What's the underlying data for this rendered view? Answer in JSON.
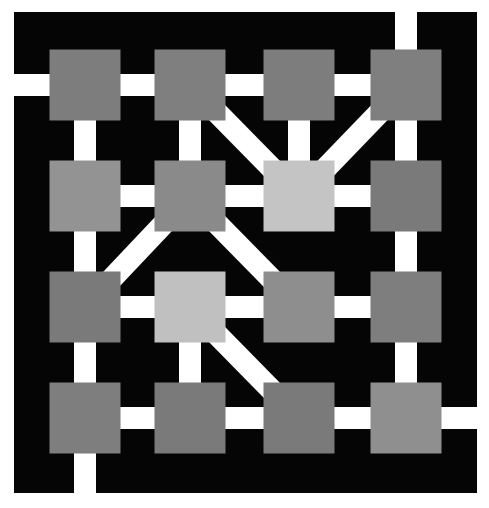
{
  "game": {
    "title": "Network connection grid puzzle",
    "grid": {
      "rows": 4,
      "cols": 4
    },
    "colors": {
      "background": "#ffffff",
      "board": "#050505",
      "wire": "#ffffff"
    },
    "tiles": [
      [
        {
          "shade": "#7d7d7d"
        },
        {
          "shade": "#7f7f7f"
        },
        {
          "shade": "#7d7d7d"
        },
        {
          "shade": "#7f7f7f"
        }
      ],
      [
        {
          "shade": "#939393"
        },
        {
          "shade": "#8a8a8a"
        },
        {
          "shade": "#c4c4c4"
        },
        {
          "shade": "#7a7a7a"
        }
      ],
      [
        {
          "shade": "#7a7a7a"
        },
        {
          "shade": "#c0c0c0"
        },
        {
          "shade": "#8e8e8e"
        },
        {
          "shade": "#7e7e7e"
        }
      ],
      [
        {
          "shade": "#7e7e7e"
        },
        {
          "shade": "#7a7a7a"
        },
        {
          "shade": "#7a7a7a"
        },
        {
          "shade": "#8f8f8f"
        }
      ]
    ],
    "connections": [
      [
        [
          0,
          -1
        ],
        [
          0,
          0
        ]
      ],
      [
        [
          0,
          0
        ],
        [
          0,
          1
        ]
      ],
      [
        [
          0,
          1
        ],
        [
          0,
          2
        ]
      ],
      [
        [
          0,
          2
        ],
        [
          0,
          3
        ]
      ],
      [
        [
          -1,
          3
        ],
        [
          0,
          3
        ]
      ],
      [
        [
          0,
          1
        ],
        [
          1,
          2
        ]
      ],
      [
        [
          0,
          3
        ],
        [
          1,
          2
        ]
      ],
      [
        [
          0,
          0
        ],
        [
          1,
          0
        ]
      ],
      [
        [
          0,
          1
        ],
        [
          1,
          1
        ]
      ],
      [
        [
          0,
          2
        ],
        [
          1,
          2
        ]
      ],
      [
        [
          0,
          3
        ],
        [
          1,
          3
        ]
      ],
      [
        [
          1,
          0
        ],
        [
          1,
          1
        ]
      ],
      [
        [
          1,
          1
        ],
        [
          1,
          2
        ]
      ],
      [
        [
          1,
          2
        ],
        [
          1,
          3
        ]
      ],
      [
        [
          1,
          1
        ],
        [
          2,
          0
        ]
      ],
      [
        [
          1,
          1
        ],
        [
          2,
          2
        ]
      ],
      [
        [
          1,
          0
        ],
        [
          2,
          0
        ]
      ],
      [
        [
          1,
          3
        ],
        [
          2,
          3
        ]
      ],
      [
        [
          2,
          0
        ],
        [
          2,
          1
        ]
      ],
      [
        [
          2,
          1
        ],
        [
          2,
          2
        ]
      ],
      [
        [
          2,
          2
        ],
        [
          2,
          3
        ]
      ],
      [
        [
          2,
          1
        ],
        [
          3,
          2
        ]
      ],
      [
        [
          2,
          0
        ],
        [
          3,
          0
        ]
      ],
      [
        [
          2,
          1
        ],
        [
          3,
          1
        ]
      ],
      [
        [
          2,
          3
        ],
        [
          3,
          3
        ]
      ],
      [
        [
          3,
          0
        ],
        [
          3,
          1
        ]
      ],
      [
        [
          3,
          1
        ],
        [
          3,
          2
        ]
      ],
      [
        [
          3,
          2
        ],
        [
          3,
          3
        ]
      ],
      [
        [
          3,
          3
        ],
        [
          3,
          4
        ]
      ],
      [
        [
          3,
          0
        ],
        [
          4,
          0
        ]
      ]
    ]
  }
}
